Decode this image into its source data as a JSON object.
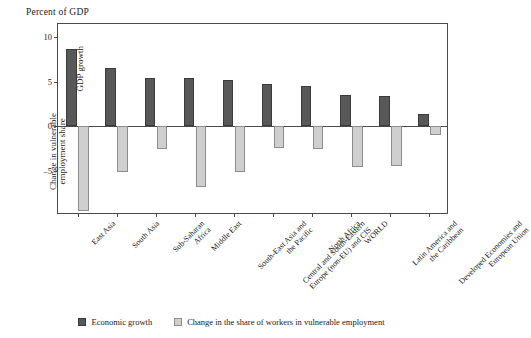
{
  "chart_data": {
    "type": "bar",
    "title": "Percent of GDP",
    "xlabel": "",
    "ylabel_primary": "GDP growth",
    "ylabel_secondary_line1": "Change in vulnerable",
    "ylabel_secondary_line2": "employment share",
    "ylim": [
      -10,
      11.5
    ],
    "yticks": [
      10,
      5,
      0,
      -5
    ],
    "ytick_labels": [
      "10",
      "5",
      "0",
      "–5"
    ],
    "grid": false,
    "legend_position": "bottom-center",
    "categories": [
      "East Asia",
      "South Asia",
      "Sub-Saharan Africa",
      "Middle East",
      "South-East Asia and the Pacific",
      "Central and South-Eastern Europe (non-EU) and CIS",
      "North Africa",
      "WORLD",
      "Latin America and the Caribbean",
      "Developed Economies and European Union"
    ],
    "category_lines": [
      [
        "East Asia"
      ],
      [
        "South Asia"
      ],
      [
        "Sub-Saharan",
        "Africa"
      ],
      [
        "Middle East"
      ],
      [
        "South-East Asia and",
        "the Pacific"
      ],
      [
        "Central and South-Eastern",
        "Europe (non-EU) and CIS"
      ],
      [
        "North Africa"
      ],
      [
        "WORLD"
      ],
      [
        "Latin America and",
        "the Caribbean"
      ],
      [
        "Developed Economies and",
        "European Union"
      ]
    ],
    "series": [
      {
        "name": "Economic growth",
        "color": "#585858",
        "values": [
          8.7,
          6.6,
          5.4,
          5.4,
          5.2,
          4.8,
          4.5,
          3.5,
          3.4,
          1.4
        ]
      },
      {
        "name": "Change in the share of workers in vulnerable employment",
        "color": "#cfcfcf",
        "values": [
          -9.6,
          -5.2,
          -2.6,
          -6.8,
          -5.2,
          -2.5,
          -2.6,
          -4.6,
          -4.5,
          -1.0
        ]
      }
    ]
  },
  "legend": {
    "items": [
      {
        "label": "Economic growth",
        "style": "dark"
      },
      {
        "label": "Change in the share of workers in vulnerable employment",
        "style": "light"
      }
    ]
  }
}
